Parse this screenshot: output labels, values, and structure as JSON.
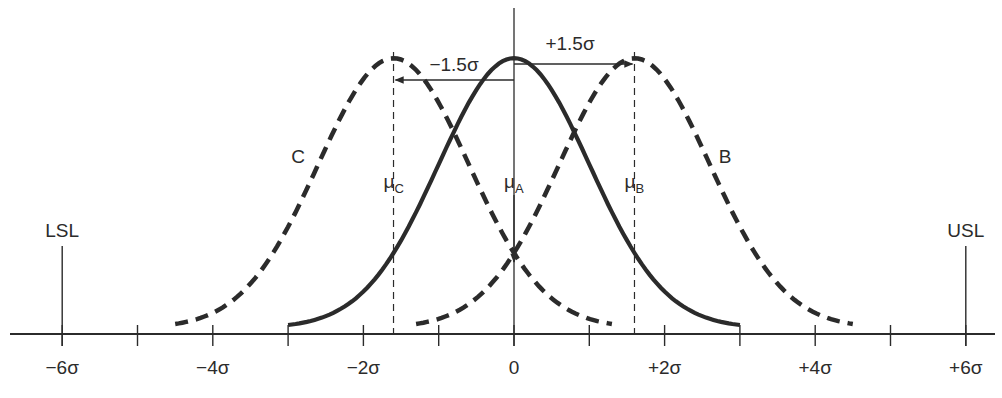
{
  "chart_data": {
    "type": "line",
    "title": "",
    "x_axis": {
      "unit": "sigma",
      "range": [
        -6,
        6
      ],
      "tick_values": [
        -6,
        -5,
        -4,
        -3,
        -2,
        -1,
        0,
        1,
        2,
        3,
        4,
        5,
        6
      ],
      "tick_labels": [
        {
          "value": -6,
          "text": "−6σ"
        },
        {
          "value": -4,
          "text": "−4σ"
        },
        {
          "value": -2,
          "text": "−2σ"
        },
        {
          "value": 0,
          "text": "0"
        },
        {
          "value": 2,
          "text": "+2σ"
        },
        {
          "value": 4,
          "text": "+4σ"
        },
        {
          "value": 6,
          "text": "+6σ"
        }
      ]
    },
    "series": [
      {
        "name": "A",
        "label": "",
        "mean": 0,
        "sd": 1,
        "style": "solid",
        "x_range": [
          -3,
          3
        ],
        "mean_label": "μ",
        "mean_sub": "A"
      },
      {
        "name": "B",
        "label": "B",
        "mean": 1.6,
        "sd": 1,
        "style": "dashed",
        "x_range": [
          -1.3,
          4.5
        ],
        "mean_label": "μ",
        "mean_sub": "B"
      },
      {
        "name": "C",
        "label": "C",
        "mean": -1.6,
        "sd": 1,
        "style": "dashed",
        "x_range": [
          -4.5,
          1.3
        ],
        "mean_label": "μ",
        "mean_sub": "C"
      }
    ],
    "shift_annotations": [
      {
        "text": "−1.5σ",
        "from": 0,
        "to": -1.6,
        "direction": "left"
      },
      {
        "text": "+1.5σ",
        "from": 0,
        "to": 1.6,
        "direction": "right"
      }
    ],
    "spec_limits": [
      {
        "name": "LSL",
        "value": -6
      },
      {
        "name": "USL",
        "value": 6
      }
    ],
    "grid": false,
    "legend": "none"
  }
}
